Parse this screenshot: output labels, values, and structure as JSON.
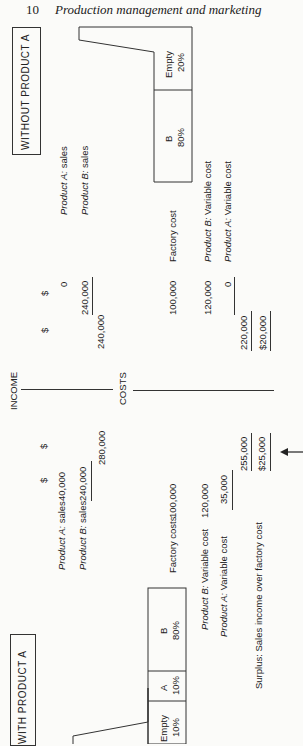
{
  "header": {
    "page_number": "10",
    "running_title": "Production management and marketing"
  },
  "without": {
    "title": "WITHOUT PRODUCT A",
    "factory": [
      {
        "label": "Empty",
        "pct": "20%"
      },
      {
        "label": "B",
        "pct": "80%"
      }
    ],
    "currency_1": "$",
    "currency_2": "$",
    "income": [
      {
        "label_prefix": "Product A:",
        "label_suffix": " sales",
        "value": "0"
      },
      {
        "label_prefix": "Product B:",
        "label_suffix": " sales",
        "value": "240,000"
      }
    ],
    "income_total": "240,000",
    "factory_cost": {
      "label": "Factory cost",
      "value": "100,000"
    },
    "variable": [
      {
        "label_prefix": "Product B:",
        "label_suffix": " Variable cost",
        "value": "120,000"
      },
      {
        "label_prefix": "Product A:",
        "label_suffix": " Variable cost",
        "value": "0"
      }
    ],
    "cost_total": "220,000",
    "surplus": "$20,000"
  },
  "middle": {
    "income_label": "INCOME",
    "costs_label": "COSTS"
  },
  "with": {
    "title": "WITH PRODUCT A",
    "factory": [
      {
        "label": "Empty",
        "pct": "10%"
      },
      {
        "label": "A",
        "pct": "10%"
      },
      {
        "label": "B",
        "pct": "80%"
      }
    ],
    "currency_1": "$",
    "currency_2": "$",
    "income": [
      {
        "label_prefix": "Product A:",
        "label_suffix": " sales",
        "value": "40,000"
      },
      {
        "label_prefix": "Product B:",
        "label_suffix": " sales",
        "value": "240,000"
      }
    ],
    "income_total": "280,000",
    "factory_cost": {
      "label": "Factory costs",
      "value": "100,000"
    },
    "variable": [
      {
        "label_prefix": "Product B:",
        "label_suffix": " Variable cost",
        "value": "120,000"
      },
      {
        "label_prefix": "Product A:",
        "label_suffix": " Variable cost",
        "value": "35,000"
      }
    ],
    "cost_total": "255,000",
    "surplus_label": "Surplus: Sales income over factory cost",
    "surplus": "$25,000",
    "arrow": "left-arrow"
  }
}
